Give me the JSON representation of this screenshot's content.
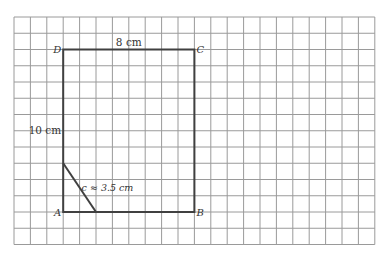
{
  "diagram": {
    "type": "geometry-grid",
    "grid": {
      "origin_x": 14,
      "origin_y": 17,
      "cell_size": 16.25,
      "columns": 22,
      "rows": 14,
      "line_color": "#9a9a9a"
    },
    "shape": {
      "stroke_color": "#404040",
      "vertices": {
        "A": {
          "label": "A",
          "col": 3,
          "row": 12
        },
        "B": {
          "label": "B",
          "col": 11,
          "row": 12
        },
        "C": {
          "label": "C",
          "col": 11,
          "row": 2
        },
        "D": {
          "label": "D",
          "col": 3,
          "row": 2
        }
      },
      "cut_segment": {
        "from": {
          "col": 3,
          "row": 9
        },
        "to": {
          "col": 5,
          "row": 12
        }
      }
    },
    "labels": {
      "top_side": "8 cm",
      "left_side": "10 cm",
      "diagonal": "c ≈ 3.5 cm"
    }
  }
}
